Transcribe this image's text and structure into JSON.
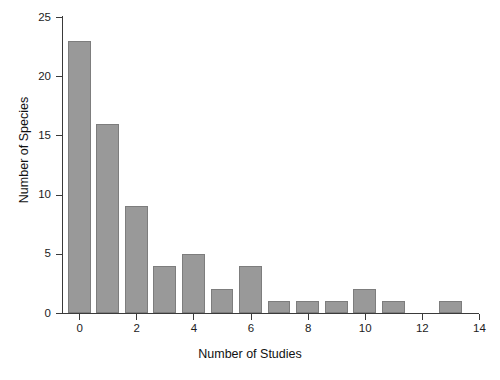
{
  "chart_data": {
    "type": "bar",
    "title": "",
    "subtitle": "",
    "xlabel": "Number of Studies",
    "ylabel": "Number of Species",
    "categories": [
      0,
      1,
      2,
      3,
      4,
      5,
      6,
      7,
      8,
      9,
      10,
      11,
      12,
      13
    ],
    "values": [
      23,
      16,
      9,
      4,
      5,
      2,
      4,
      1,
      1,
      1,
      2,
      1,
      0,
      1
    ],
    "xlim": [
      -0.6,
      14
    ],
    "ylim": [
      0,
      25
    ],
    "x_ticks": [
      0,
      2,
      4,
      6,
      8,
      10,
      12,
      14
    ],
    "x_tick_labels": [
      "0",
      "2",
      "4",
      "6",
      "8",
      "10",
      "12",
      "14"
    ],
    "y_ticks": [
      0,
      5,
      10,
      15,
      20,
      25
    ],
    "y_tick_labels": [
      "0",
      "5",
      "10",
      "15",
      "20",
      "25"
    ],
    "grid": false,
    "legend": null,
    "bar_color": "#999999",
    "bar_edge_color": "#7d7d7d",
    "axis_color": "#3a3a3a",
    "bar_width_units": 0.8,
    "background": "#ffffff"
  }
}
